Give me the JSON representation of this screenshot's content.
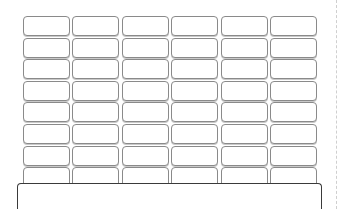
{
  "grid": {
    "columns": 6,
    "rows": 8,
    "cells": [
      [
        "",
        "",
        "",
        "",
        "",
        ""
      ],
      [
        "",
        "",
        "",
        "",
        "",
        ""
      ],
      [
        "",
        "",
        "",
        "",
        "",
        ""
      ],
      [
        "",
        "",
        "",
        "",
        "",
        ""
      ],
      [
        "",
        "",
        "",
        "",
        "",
        ""
      ],
      [
        "",
        "",
        "",
        "",
        "",
        ""
      ],
      [
        "",
        "",
        "",
        "",
        "",
        ""
      ],
      [
        "",
        "",
        "",
        "",
        "",
        ""
      ]
    ],
    "border_color": "#8a8a8a"
  },
  "bottom_panel": {
    "label": "",
    "border_color": "#3a3a3a"
  },
  "divider": {
    "color": "#cfcfcf"
  }
}
